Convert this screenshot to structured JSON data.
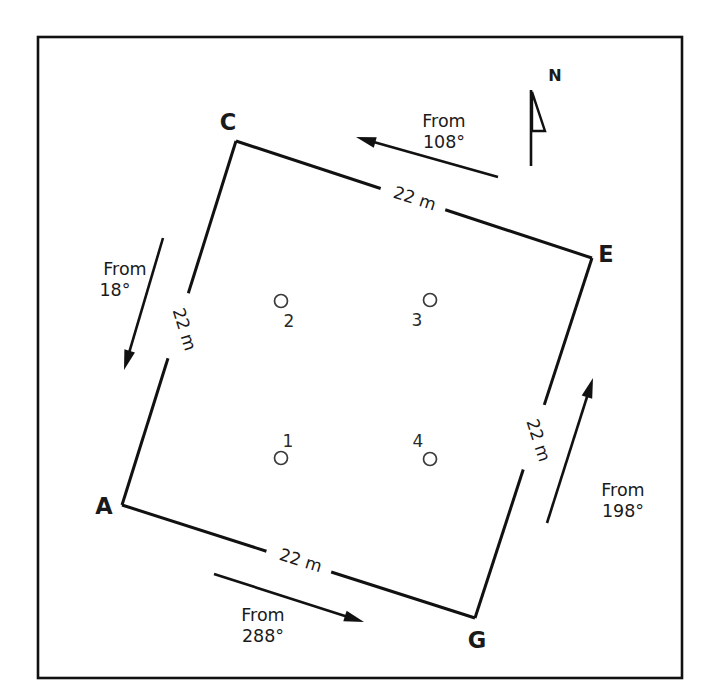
{
  "figure": {
    "frame": {
      "x": 38,
      "y": 37,
      "width": 644,
      "height": 641
    },
    "background_color": "#ffffff",
    "line_color": "#111111"
  },
  "plot": {
    "shape": "quadrilateral",
    "corners": [
      {
        "id": "A",
        "label": "A",
        "x": 122,
        "y": 505,
        "label_x": 104,
        "label_y": 514
      },
      {
        "id": "C",
        "label": "C",
        "x": 236,
        "y": 141,
        "label_x": 228,
        "label_y": 130
      },
      {
        "id": "E",
        "label": "E",
        "x": 592,
        "y": 258,
        "label_x": 606,
        "label_y": 262
      },
      {
        "id": "G",
        "label": "G",
        "x": 475,
        "y": 618,
        "label_x": 477,
        "label_y": 648
      }
    ],
    "edges": [
      {
        "id": "edge-CE",
        "from": "C",
        "to": "E",
        "length_label": "22 m",
        "label_x": 413,
        "label_y": 199,
        "label_rotation": 18
      },
      {
        "id": "edge-EG",
        "from": "E",
        "to": "G",
        "length_label": "22 m",
        "label_x": 533,
        "label_y": 437,
        "label_rotation": 72
      },
      {
        "id": "edge-AG",
        "from": "A",
        "to": "G",
        "length_label": "22 m",
        "label_x": 299,
        "label_y": 561,
        "label_rotation": 17
      },
      {
        "id": "edge-AC",
        "from": "A",
        "to": "C",
        "length_label": "22 m",
        "label_x": 179,
        "label_y": 326,
        "label_rotation": 73
      }
    ]
  },
  "stations": [
    {
      "id": "station-1",
      "label": "1",
      "cx": 281,
      "cy": 458,
      "r": 6.5,
      "label_x": 288,
      "label_y": 447
    },
    {
      "id": "station-2",
      "label": "2",
      "cx": 281,
      "cy": 301,
      "r": 6.5,
      "label_x": 289,
      "label_y": 327
    },
    {
      "id": "station-3",
      "label": "3",
      "cx": 430,
      "cy": 300,
      "r": 6.5,
      "label_x": 417,
      "label_y": 326
    },
    {
      "id": "station-4",
      "label": "4",
      "cx": 430,
      "cy": 459,
      "r": 6.5,
      "label_x": 418,
      "label_y": 447
    }
  ],
  "wind_arrows": [
    {
      "id": "wind-108",
      "from_text": "From",
      "degrees_text": "108°",
      "x1": 498,
      "y1": 177,
      "x2": 356,
      "y2": 137,
      "text_x": 444,
      "text_y": 127,
      "text_x2": 444,
      "text_y2": 148
    },
    {
      "id": "wind-18",
      "from_text": "From",
      "degrees_text": "18°",
      "x1": 163,
      "y1": 238,
      "x2": 124,
      "y2": 370,
      "text_x": 125,
      "text_y": 275,
      "text_x2": 115,
      "text_y2": 296
    },
    {
      "id": "wind-198",
      "from_text": "From",
      "degrees_text": "198°",
      "x1": 547,
      "y1": 523,
      "x2": 593,
      "y2": 378,
      "text_x": 623,
      "text_y": 496,
      "text_x2": 623,
      "text_y2": 517
    },
    {
      "id": "wind-288",
      "from_text": "From",
      "degrees_text": "288°",
      "x1": 214,
      "y1": 574,
      "x2": 364,
      "y2": 622,
      "text_x": 263,
      "text_y": 621,
      "text_x2": 263,
      "text_y2": 642
    }
  ],
  "north_indicator": {
    "label": "N",
    "label_x": 555,
    "label_y": 81,
    "line_x": 531,
    "line_top": 90,
    "line_bottom": 166,
    "flag_points": "532,92 545,131 532,131"
  }
}
